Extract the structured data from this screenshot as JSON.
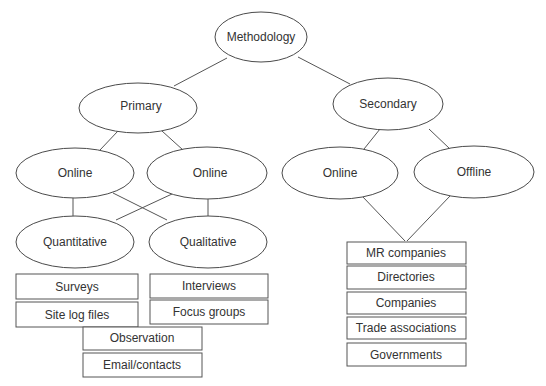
{
  "diagram": {
    "title": "Methodology",
    "colors": {
      "stroke": "#555555",
      "text": "#333333",
      "background": "#ffffff"
    },
    "nodes": {
      "methodology": {
        "label": "Methodology",
        "shape": "ellipse"
      },
      "primary": {
        "label": "Primary",
        "shape": "ellipse"
      },
      "secondary": {
        "label": "Secondary",
        "shape": "ellipse"
      },
      "primary_online_1": {
        "label": "Online",
        "shape": "ellipse"
      },
      "primary_online_2": {
        "label": "Online",
        "shape": "ellipse"
      },
      "secondary_online": {
        "label": "Online",
        "shape": "ellipse"
      },
      "secondary_offline": {
        "label": "Offline",
        "shape": "ellipse"
      },
      "quantitative": {
        "label": "Quantitative",
        "shape": "ellipse"
      },
      "qualitative": {
        "label": "Qualitative",
        "shape": "ellipse"
      }
    },
    "quantitative_methods": [
      "Surveys",
      "Site log files"
    ],
    "qualitative_methods": [
      "Interviews",
      "Focus groups"
    ],
    "shared_methods": [
      "Observation",
      "Email/contacts"
    ],
    "secondary_sources": [
      "MR companies",
      "Directories",
      "Companies",
      "Trade associations",
      "Governments"
    ],
    "edges": [
      [
        "Methodology",
        "Primary"
      ],
      [
        "Methodology",
        "Secondary"
      ],
      [
        "Primary",
        "Online (1)"
      ],
      [
        "Primary",
        "Online (2)"
      ],
      [
        "Secondary",
        "Online (3)"
      ],
      [
        "Secondary",
        "Offline"
      ],
      [
        "Online (1)",
        "Quantitative"
      ],
      [
        "Online (1)",
        "Qualitative"
      ],
      [
        "Online (2)",
        "Quantitative"
      ],
      [
        "Online (2)",
        "Qualitative"
      ],
      [
        "Online (3)",
        "MR companies"
      ],
      [
        "Offline",
        "MR companies"
      ]
    ]
  }
}
